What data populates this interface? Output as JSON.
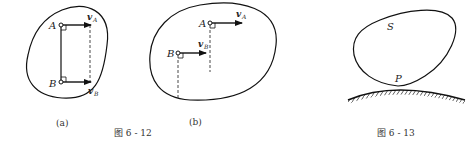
{
  "figure_612": {
    "caption": "图 6 - 12",
    "panel_a": {
      "label": "(a)",
      "point_A": "A",
      "point_B": "B",
      "vel_A": "v",
      "vel_A_sub": "A",
      "vel_B": "v",
      "vel_B_sub": "B"
    },
    "panel_b": {
      "label": "(b)",
      "point_A": "A",
      "point_B": "B",
      "vel_A": "v",
      "vel_A_sub": "A",
      "vel_B": "v",
      "vel_B_sub": "B"
    }
  },
  "figure_613": {
    "caption": "图 6 - 13",
    "body_label": "S",
    "contact_label": "P"
  }
}
